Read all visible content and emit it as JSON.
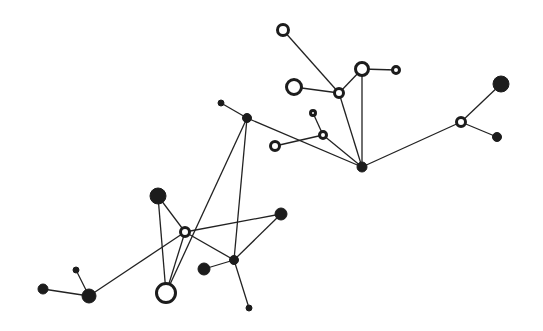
{
  "diagram": {
    "type": "network-graph",
    "width": 543,
    "height": 331,
    "colors": {
      "background": "#ffffff",
      "ink": "#1c1c1c",
      "edge": "#222222"
    },
    "nodes": [
      {
        "id": "A",
        "x": 283,
        "y": 30,
        "r": 7,
        "style": "open"
      },
      {
        "id": "B",
        "x": 294,
        "y": 87,
        "r": 9,
        "style": "open"
      },
      {
        "id": "C",
        "x": 339,
        "y": 93,
        "r": 6,
        "style": "open"
      },
      {
        "id": "D",
        "x": 362,
        "y": 69,
        "r": 8,
        "style": "open"
      },
      {
        "id": "E",
        "x": 396,
        "y": 70,
        "r": 5,
        "style": "open"
      },
      {
        "id": "F",
        "x": 362,
        "y": 167,
        "r": 5,
        "style": "filled"
      },
      {
        "id": "G",
        "x": 313,
        "y": 113,
        "r": 4,
        "style": "open"
      },
      {
        "id": "H",
        "x": 323,
        "y": 135,
        "r": 5,
        "style": "open"
      },
      {
        "id": "I",
        "x": 275,
        "y": 146,
        "r": 6,
        "style": "open"
      },
      {
        "id": "J",
        "x": 247,
        "y": 118,
        "r": 4.5,
        "style": "filled"
      },
      {
        "id": "K",
        "x": 221,
        "y": 103,
        "r": 3,
        "style": "filled"
      },
      {
        "id": "L",
        "x": 461,
        "y": 122,
        "r": 6,
        "style": "open"
      },
      {
        "id": "M",
        "x": 501,
        "y": 84,
        "r": 8,
        "style": "filled"
      },
      {
        "id": "N",
        "x": 497,
        "y": 137,
        "r": 4.5,
        "style": "filled"
      },
      {
        "id": "O",
        "x": 158,
        "y": 196,
        "r": 8,
        "style": "filled"
      },
      {
        "id": "P",
        "x": 185,
        "y": 232,
        "r": 6,
        "style": "open"
      },
      {
        "id": "Q",
        "x": 281,
        "y": 214,
        "r": 6,
        "style": "filled"
      },
      {
        "id": "R",
        "x": 234,
        "y": 260,
        "r": 4.5,
        "style": "filled"
      },
      {
        "id": "S",
        "x": 204,
        "y": 269,
        "r": 6,
        "style": "filled"
      },
      {
        "id": "T",
        "x": 249,
        "y": 308,
        "r": 3,
        "style": "filled"
      },
      {
        "id": "U",
        "x": 166,
        "y": 293,
        "r": 11,
        "style": "open"
      },
      {
        "id": "V",
        "x": 89,
        "y": 296,
        "r": 7,
        "style": "filled"
      },
      {
        "id": "W",
        "x": 43,
        "y": 289,
        "r": 5,
        "style": "filled"
      },
      {
        "id": "X",
        "x": 76,
        "y": 270,
        "r": 3,
        "style": "filled"
      }
    ],
    "edges": [
      [
        "A",
        "C"
      ],
      [
        "B",
        "C"
      ],
      [
        "C",
        "D"
      ],
      [
        "D",
        "E"
      ],
      [
        "C",
        "F"
      ],
      [
        "D",
        "F"
      ],
      [
        "G",
        "H"
      ],
      [
        "H",
        "F"
      ],
      [
        "I",
        "H"
      ],
      [
        "K",
        "J"
      ],
      [
        "J",
        "F"
      ],
      [
        "F",
        "L"
      ],
      [
        "L",
        "M"
      ],
      [
        "L",
        "N"
      ],
      [
        "J",
        "U"
      ],
      [
        "J",
        "R"
      ],
      [
        "O",
        "P"
      ],
      [
        "O",
        "U"
      ],
      [
        "P",
        "U"
      ],
      [
        "P",
        "Q"
      ],
      [
        "P",
        "R"
      ],
      [
        "P",
        "V"
      ],
      [
        "Q",
        "R"
      ],
      [
        "S",
        "R"
      ],
      [
        "R",
        "T"
      ],
      [
        "V",
        "W"
      ],
      [
        "V",
        "X"
      ]
    ]
  }
}
